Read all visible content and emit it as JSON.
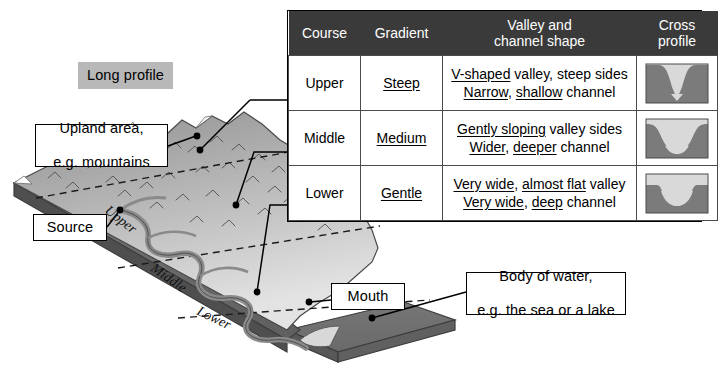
{
  "diagram": {
    "title_badge": "Long profile",
    "callouts": [
      {
        "id": "upland",
        "text_line1": "Upland area,",
        "text_line2": "e.g. mountains"
      },
      {
        "id": "source",
        "text": "Source"
      },
      {
        "id": "mouth",
        "text": "Mouth"
      },
      {
        "id": "body",
        "text_line1": "Body of water,",
        "text_line2": "e.g. the sea or a lake"
      }
    ],
    "course_labels": [
      "Upper",
      "Middle",
      "Lower"
    ],
    "colors": {
      "badge_fill": "#b8b8b8",
      "header_fill": "#3a3a3a",
      "terrain_dark": "#6f6f6f",
      "terrain_mid": "#9a9a9a",
      "terrain_light": "#d5d5d5",
      "sea_slab": "#6e6e6e",
      "river": "#8c8c8c",
      "cross_profile_fill": "#7b7b7b",
      "cross_profile_water": "#d9d9d9"
    }
  },
  "table": {
    "headers": {
      "course": "Course",
      "gradient": "Gradient",
      "shape_line1": "Valley and",
      "shape_line2": "channel shape",
      "cross_line1": "Cross",
      "cross_line2": "profile"
    },
    "rows": [
      {
        "course": "Upper",
        "gradient": "Steep",
        "shape": {
          "line1": [
            {
              "t": "V-shaped",
              "u": true
            },
            {
              "t": " valley, steep sides",
              "u": false
            }
          ],
          "line2": [
            {
              "t": "Narrow",
              "u": true
            },
            {
              "t": ", ",
              "u": false
            },
            {
              "t": "shallow",
              "u": true
            },
            {
              "t": " channel",
              "u": false
            }
          ]
        },
        "cross_profile": "v-shaped-narrow"
      },
      {
        "course": "Middle",
        "gradient": "Medium",
        "shape": {
          "line1": [
            {
              "t": "Gently sloping",
              "u": true
            },
            {
              "t": " valley sides",
              "u": false
            }
          ],
          "line2": [
            {
              "t": "Wider",
              "u": true
            },
            {
              "t": ", ",
              "u": false
            },
            {
              "t": "deeper",
              "u": true
            },
            {
              "t": " channel",
              "u": false
            }
          ]
        },
        "cross_profile": "u-shaped-wide"
      },
      {
        "course": "Lower",
        "gradient": "Gentle",
        "shape": {
          "line1": [
            {
              "t": "Very wide",
              "u": true
            },
            {
              "t": ", ",
              "u": false
            },
            {
              "t": "almost flat",
              "u": true
            },
            {
              "t": " valley",
              "u": false
            }
          ],
          "line2": [
            {
              "t": "Very wide",
              "u": true
            },
            {
              "t": ", ",
              "u": false
            },
            {
              "t": "deep",
              "u": true
            },
            {
              "t": " channel",
              "u": false
            }
          ]
        },
        "cross_profile": "flat-basin"
      }
    ]
  }
}
